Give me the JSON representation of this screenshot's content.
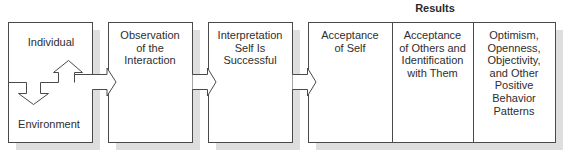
{
  "figure": {
    "results_header": "Results",
    "colors": {
      "stroke": "#4a4a4a",
      "shadow": "#dcdcdc",
      "fill": "#ffffff"
    },
    "boxes": [
      {
        "id": "individual-environment",
        "top_label": "Individual",
        "bottom_label": "Environment"
      },
      {
        "id": "observation",
        "label": "Observation of the Interaction",
        "lines": [
          "Observation",
          "of the",
          "Interaction"
        ]
      },
      {
        "id": "interpretation",
        "label": "Interpretation Self Is Successful",
        "lines": [
          "Interpretation",
          "Self Is",
          "Successful"
        ]
      }
    ],
    "results": [
      {
        "id": "acceptance-self",
        "lines": [
          "Acceptance",
          "of Self"
        ]
      },
      {
        "id": "acceptance-others",
        "lines": [
          "Acceptance",
          "of Others and",
          "Identification",
          "with Them"
        ]
      },
      {
        "id": "optimism",
        "lines": [
          "Optimism,",
          "Openness,",
          "Objectivity,",
          "and Other",
          "Positive",
          "Behavior",
          "Patterns"
        ]
      }
    ]
  }
}
